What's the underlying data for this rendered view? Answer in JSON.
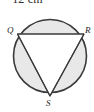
{
  "figure": {
    "name": "circle-with-inscribed-triangle",
    "caption_text": "= 12 cm",
    "background_color": "#ffffff",
    "circle": {
      "name": "circle-outline",
      "center_x": 50,
      "center_y": 56,
      "radius": 36.5,
      "fill_color": "#e8e8e8",
      "stroke_color": "#3a3a3a",
      "stroke_width": 1.6
    },
    "triangle": {
      "name": "inscribed-triangle-QRS",
      "fill_color": "#ffffff",
      "stroke_color": "#3a3a3a",
      "stroke_width": 1.2,
      "points": "17.5,34 84,34 50,96"
    },
    "vertices": [
      {
        "id": "Q",
        "label": "Q",
        "x": 17.5,
        "y": 34,
        "label_x": 7,
        "label_y": 26
      },
      {
        "id": "R",
        "label": "R",
        "x": 84,
        "y": 34,
        "label_x": 85,
        "label_y": 26
      },
      {
        "id": "S",
        "label": "S",
        "x": 50,
        "y": 96,
        "label_x": 46,
        "label_y": 99
      }
    ],
    "chord": {
      "name": "chord-QR",
      "from": "Q",
      "to": "R",
      "x1": 17.5,
      "y1": 34,
      "x2": 84,
      "y2": 34
    }
  }
}
